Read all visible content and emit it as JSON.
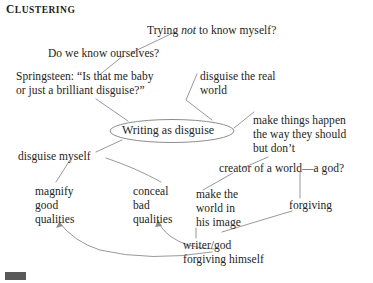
{
  "title": {
    "first_letter": "C",
    "rest": "LUSTERING",
    "full": "CLUSTERING"
  },
  "center_node": {
    "label": "Writing as disguise",
    "shape": "ellipse"
  },
  "nodes": [
    {
      "id": "trying-not",
      "text": "Trying not to know myself?",
      "pre": "Trying ",
      "italic": "not",
      "post": " to know myself?"
    },
    {
      "id": "do-we-know",
      "text": "Do we know ourselves?"
    },
    {
      "id": "springsteen-1",
      "text": "Springsteen: “Is that me baby"
    },
    {
      "id": "springsteen-2",
      "text": "or just a brilliant disguise?”"
    },
    {
      "id": "disguise-real-1",
      "text": "disguise the real"
    },
    {
      "id": "disguise-real-2",
      "text": "world"
    },
    {
      "id": "make-things-1",
      "text": "make things happen"
    },
    {
      "id": "make-things-2",
      "text": "the way they should"
    },
    {
      "id": "make-things-3",
      "text": "but don’t"
    },
    {
      "id": "disguise-myself",
      "text": "disguise myself"
    },
    {
      "id": "creator",
      "text": "creator of a world—a god?"
    },
    {
      "id": "magnify-1",
      "text": "magnify"
    },
    {
      "id": "magnify-2",
      "text": "good"
    },
    {
      "id": "magnify-3",
      "text": "qualities"
    },
    {
      "id": "conceal-1",
      "text": "conceal"
    },
    {
      "id": "conceal-2",
      "text": "bad"
    },
    {
      "id": "conceal-3",
      "text": "qualities"
    },
    {
      "id": "make-world-1",
      "text": "make the"
    },
    {
      "id": "make-world-2",
      "text": "world in"
    },
    {
      "id": "make-world-3",
      "text": "his image"
    },
    {
      "id": "forgiving",
      "text": "forgiving"
    },
    {
      "id": "writer-god-1",
      "text": "writer/god"
    },
    {
      "id": "writer-god-2",
      "text": "forgiving himself"
    }
  ],
  "colors": {
    "ink": "#242424",
    "line": "#8d8d8d",
    "background": "#ffffff",
    "page_mark": "#595959"
  }
}
